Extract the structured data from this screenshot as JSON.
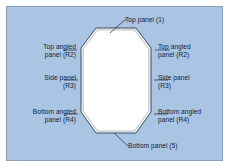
{
  "diagram": {
    "background_color": "#a9c5e3",
    "frame_border_color": "#8d9fb4",
    "shape_fill_color": "#ffffff",
    "shape_outline_color": "#2b3a52",
    "shape_inner_band_color": "#f2f2f0",
    "leader_line_color": "#2b3a52",
    "text_color": "#14213a",
    "shape_name": "octagon"
  },
  "labels": {
    "top_panel": "Top panel (1)",
    "top_angled_panel_left": "Top angled\npanel (R2)",
    "top_angled_panel_right": "Top angled\npanel (R2)",
    "side_panel_left": "Side panel\n(R3)",
    "side_panel_right": "Side panel\n(R3)",
    "bottom_angled_panel_left": "Bottom angled\npanel (R4)",
    "bottom_angled_panel_right": "Bottom angled\npanel (R4)",
    "bottom_panel": "Bottom panel (5)"
  }
}
